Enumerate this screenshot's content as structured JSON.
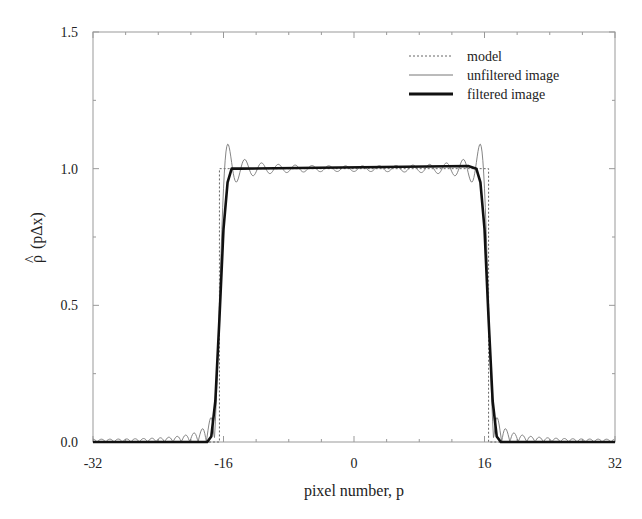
{
  "chart_data": {
    "type": "line",
    "title": "",
    "xlabel": "pixel number, p",
    "ylabel": "ρ̂ (pΔx)",
    "ylabel_hat": "^",
    "ylabel_rho": "ρ",
    "ylabel_rest": "(pΔx)",
    "xlim": [
      -32,
      32
    ],
    "ylim": [
      0.0,
      1.5
    ],
    "x_ticks": [
      -32,
      -16,
      0,
      16,
      32
    ],
    "x_tick_labels": [
      "-32",
      "-16",
      "0",
      "16",
      "32"
    ],
    "x_minor_step": 4,
    "y_ticks": [
      0.0,
      0.5,
      1.0,
      1.5
    ],
    "y_tick_labels": [
      "0.0",
      "0.5",
      "1.0",
      "1.5"
    ],
    "y_minor_step": 0.25,
    "grid": false,
    "legend_position": "upper right",
    "series": [
      {
        "name": "model",
        "style": "dotted",
        "color": "#666666",
        "description": "rect function: 1.0 for |p| < 16.5, 0 otherwise",
        "x": [
          -32,
          -16.5,
          -16.5,
          16.5,
          16.5,
          32
        ],
        "y": [
          0,
          0,
          1.0,
          1.0,
          0,
          0
        ]
      },
      {
        "name": "unfiltered image",
        "style": "thin-solid",
        "color": "#777777",
        "description": "Gibbs ringing: overshoot ~1.09 near edges (p≈±15), undershoot dips to ~0.97, ripples ~±0.02 in plateau, small lobes up to ~0.05 outside edges decaying toward ±32",
        "peak_overshoot": 1.09,
        "edge_transition": [
          -17,
          -15
        ],
        "plateau_ripple": 0.02
      },
      {
        "name": "filtered image",
        "style": "thick-solid",
        "color": "#111111",
        "description": "smoothed rect: rises from 0 at p≈-17.5 to ~1.0 at p≈-15, flat 1.0 plateau with slight bump ~1.01 at p≈±14, falls to 0 at p≈17.5",
        "x": [
          -32,
          -18,
          -17.5,
          -17,
          -16.5,
          -16,
          -15.5,
          -15,
          -14,
          14,
          15,
          15.5,
          16,
          16.5,
          17,
          17.5,
          18,
          32
        ],
        "y": [
          0,
          0,
          0.02,
          0.15,
          0.45,
          0.78,
          0.95,
          1.0,
          1.0,
          1.01,
          1.0,
          0.95,
          0.78,
          0.45,
          0.15,
          0.02,
          0,
          0
        ]
      }
    ]
  },
  "legend": {
    "items": [
      {
        "label": "model",
        "style": "dotted"
      },
      {
        "label": "unfiltered image",
        "style": "thin"
      },
      {
        "label": "filtered image",
        "style": "thick"
      }
    ]
  }
}
